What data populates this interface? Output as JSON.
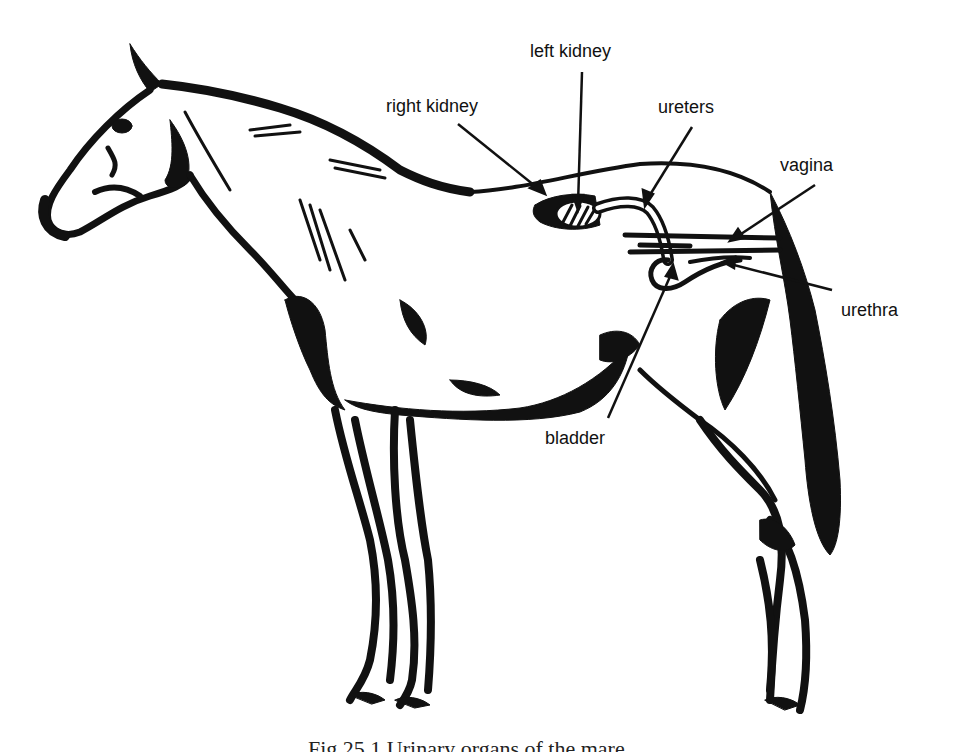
{
  "figure": {
    "style": "black ink line illustration",
    "caption": "Fig 25.1  Urinary organs of the mare",
    "caption_visible_state": "clipped at bottom edge"
  },
  "labels": {
    "left_kidney": "left kidney",
    "right_kidney": "right kidney",
    "ureters": "ureters",
    "vagina": "vagina",
    "urethra": "urethra",
    "bladder": "bladder"
  },
  "colors": {
    "ink": "#111111",
    "background": "#ffffff"
  }
}
